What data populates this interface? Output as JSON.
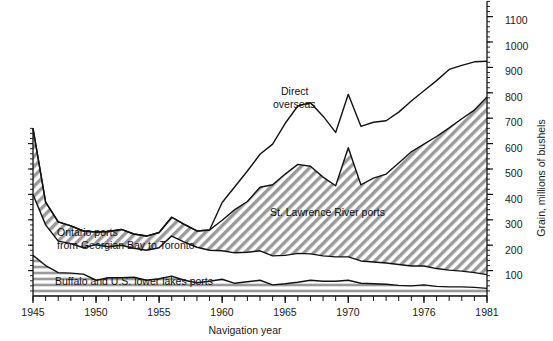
{
  "chart_data": {
    "type": "area",
    "title": "",
    "subtitle": "",
    "xlabel": "Navigation year",
    "ylabel": "Grain, millions of bushels",
    "xlim": [
      1945,
      1981
    ],
    "ylim": [
      0,
      1160
    ],
    "grid": false,
    "legend_position": "inline-annotations",
    "x": [
      1945,
      1946,
      1947,
      1948,
      1949,
      1950,
      1951,
      1952,
      1953,
      1954,
      1955,
      1956,
      1957,
      1958,
      1959,
      1960,
      1961,
      1962,
      1963,
      1964,
      1965,
      1966,
      1967,
      1968,
      1969,
      1970,
      1971,
      1972,
      1973,
      1974,
      1975,
      1976,
      1977,
      1978,
      1979,
      1980,
      1981
    ],
    "xticklabels": [
      "1945",
      "1950",
      "1955",
      "1960",
      "1965",
      "1970",
      "1976",
      "1981"
    ],
    "yticklabels": [
      "100",
      "200",
      "300",
      "400",
      "500",
      "600",
      "700",
      "800",
      "900",
      "1000",
      "1100"
    ],
    "stack_order_bottom_to_top": [
      "Buffalo and U.S. lower lakes ports",
      "Ontario ports from Georgian Bay to Toronto",
      "St. Lawrence River ports",
      "Direct overseas"
    ],
    "series": [
      {
        "name": "Buffalo and U.S. lower lakes ports",
        "fill": "horizontal-hatch",
        "values": [
          160,
          120,
          92,
          90,
          86,
          62,
          72,
          72,
          74,
          62,
          68,
          78,
          62,
          52,
          58,
          66,
          50,
          56,
          62,
          44,
          48,
          54,
          62,
          58,
          58,
          62,
          50,
          48,
          46,
          42,
          40,
          44,
          38,
          36,
          36,
          34,
          30
        ]
      },
      {
        "name": "Ontario ports from Georgian Bay to Toronto",
        "fill": "white",
        "values": [
          240,
          160,
          124,
          116,
          104,
          140,
          122,
          128,
          114,
          118,
          122,
          158,
          150,
          140,
          122,
          112,
          120,
          116,
          116,
          114,
          112,
          114,
          104,
          100,
          96,
          92,
          88,
          86,
          84,
          82,
          78,
          74,
          70,
          66,
          62,
          58,
          54
        ]
      },
      {
        "name": "St. Lawrence River ports",
        "fill": "diagonal-hatch",
        "values": [
          260,
          90,
          76,
          70,
          66,
          50,
          60,
          62,
          56,
          56,
          60,
          74,
          70,
          64,
          80,
          120,
          170,
          200,
          250,
          280,
          320,
          350,
          345,
          310,
          280,
          430,
          300,
          330,
          350,
          400,
          450,
          480,
          520,
          560,
          600,
          640,
          700
        ]
      },
      {
        "name": "Direct overseas",
        "fill": "white",
        "values": [
          0,
          0,
          0,
          0,
          0,
          0,
          0,
          0,
          0,
          0,
          0,
          0,
          0,
          0,
          0,
          70,
          90,
          120,
          130,
          160,
          200,
          230,
          250,
          240,
          210,
          210,
          230,
          220,
          210,
          200,
          200,
          210,
          220,
          230,
          210,
          190,
          140
        ]
      }
    ],
    "annotations": [
      {
        "text": "Direct overseas",
        "lines": [
          "Direct",
          "overseas"
        ],
        "x": 0.535,
        "y": 0.27
      },
      {
        "text": "St. Lawrence River ports",
        "lines": [
          "St. Lawrence River ports"
        ],
        "x": 0.6,
        "y": 0.625
      },
      {
        "text": "Ontario ports from Georgian Bay to Toronto",
        "lines": [
          "Ontario ports",
          "from Georgian Bay to Toronto"
        ],
        "x": 0.21,
        "y": 0.7
      },
      {
        "text": "Buffalo and U.S. lower lakes ports",
        "lines": [
          "Buffalo and U.S. lower lakes ports"
        ],
        "x": 0.28,
        "y": 0.865
      }
    ]
  },
  "axes": {
    "x_axis_title": "Navigation year",
    "y_axis_title": "Grain, millions of bushels",
    "x_ticks": [
      {
        "label": "1945",
        "value": 1945
      },
      {
        "label": "1950",
        "value": 1950
      },
      {
        "label": "1955",
        "value": 1955
      },
      {
        "label": "1960",
        "value": 1960
      },
      {
        "label": "1965",
        "value": 1965
      },
      {
        "label": "1970",
        "value": 1970
      },
      {
        "label": "1976",
        "value": 1976
      },
      {
        "label": "1981",
        "value": 1981
      }
    ],
    "y_ticks": [
      {
        "label": "100",
        "value": 100
      },
      {
        "label": "200",
        "value": 200
      },
      {
        "label": "300",
        "value": 300
      },
      {
        "label": "400",
        "value": 400
      },
      {
        "label": "500",
        "value": 500
      },
      {
        "label": "600",
        "value": 600
      },
      {
        "label": "700",
        "value": 700
      },
      {
        "label": "800",
        "value": 800
      },
      {
        "label": "900",
        "value": 900
      },
      {
        "label": "1000",
        "value": 1000
      },
      {
        "label": "1100",
        "value": 1100
      }
    ]
  },
  "labels": {
    "direct_overseas_line1": "Direct",
    "direct_overseas_line2": "overseas",
    "st_lawrence": "St. Lawrence River ports",
    "ontario_line1": "Ontario ports",
    "ontario_line2": "from Georgian Bay to Toronto",
    "buffalo": "Buffalo and U.S. lower lakes ports",
    "tick_1945": "1945",
    "tick_1950": "1950",
    "tick_1955": "1955",
    "tick_1960": "1960",
    "tick_1965": "1965",
    "tick_1970": "1970",
    "tick_1976": "1976",
    "tick_1981": "1981",
    "ytick_100": "100",
    "ytick_200": "200",
    "ytick_300": "300",
    "ytick_400": "400",
    "ytick_500": "500",
    "ytick_600": "600",
    "ytick_700": "700",
    "ytick_800": "800",
    "ytick_900": "900",
    "ytick_1000": "1000",
    "ytick_1100": "1100",
    "xlabel": "Navigation year",
    "ylabel": "Grain, millions of bushels"
  },
  "colors": {
    "stroke": "#111111",
    "hatch_gray": "#9a9a9a",
    "background": "#ffffff",
    "text": "#1a1a1a"
  }
}
